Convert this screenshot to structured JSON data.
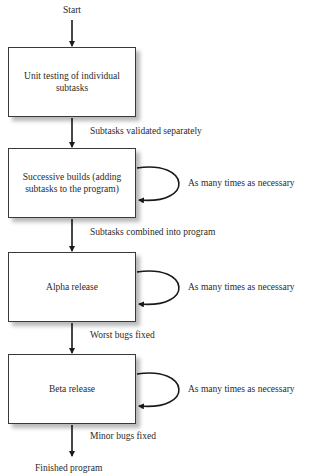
{
  "diagram": {
    "type": "flowchart",
    "start_label": "Start",
    "end_label": "Finished program",
    "steps": [
      {
        "id": "unit-testing",
        "label": "Unit testing of individual subtasks",
        "loop_label": null
      },
      {
        "id": "successive-builds",
        "label": "Successive builds (adding subtasks to the program)",
        "loop_label": "As many times as necessary"
      },
      {
        "id": "alpha-release",
        "label": "Alpha release",
        "loop_label": "As many times as necessary"
      },
      {
        "id": "beta-release",
        "label": "Beta release",
        "loop_label": "As many times as necessary"
      }
    ],
    "transitions": [
      {
        "from": "start",
        "to": "unit-testing",
        "label": ""
      },
      {
        "from": "unit-testing",
        "to": "successive-builds",
        "label": "Subtasks validated separately"
      },
      {
        "from": "successive-builds",
        "to": "alpha-release",
        "label": "Subtasks combined into program"
      },
      {
        "from": "alpha-release",
        "to": "beta-release",
        "label": "Worst bugs fixed"
      },
      {
        "from": "beta-release",
        "to": "end",
        "label": "Minor bugs fixed"
      }
    ],
    "colors": {
      "line": "#1a1a1a",
      "box_border": "#3a3a3a",
      "shadow": "#b0b0b0",
      "text": "#2a2a2a"
    }
  }
}
